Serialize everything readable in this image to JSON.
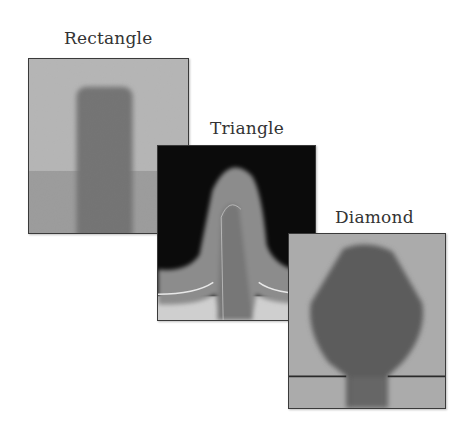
{
  "figure": {
    "panels": [
      {
        "id": "rectangle",
        "label": "Rectangle"
      },
      {
        "id": "triangle",
        "label": "Triangle"
      },
      {
        "id": "diamond",
        "label": "Diamond"
      }
    ]
  },
  "colors": {
    "rect_bg_upper": "#cfcfcf",
    "rect_bg_lower": "#a8a8a8",
    "rect_fin": "#6e6e6e",
    "tri_bg": "#0a0a0a",
    "tri_shell": "#8a8a8a",
    "tri_core": "#7a7a7a",
    "tri_base": "#cccccc",
    "dia_bg": "#a9a9a9",
    "dia_shape": "#5a5a5a",
    "border": "#3a3a3a"
  }
}
